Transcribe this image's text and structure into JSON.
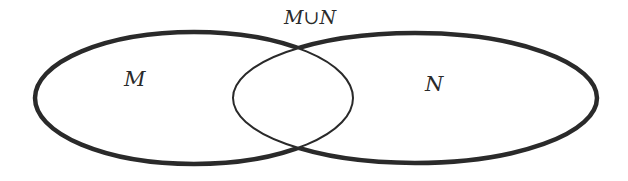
{
  "diagram": {
    "type": "venn",
    "sets": [
      {
        "name": "M",
        "label": "M"
      },
      {
        "name": "N",
        "label": "N"
      }
    ],
    "union_label": "M∪N",
    "union_parts": {
      "left": "M",
      "op": "∪",
      "right": "N"
    },
    "colors": {
      "stroke": "#2a2a2a",
      "background": "#ffffff"
    }
  }
}
